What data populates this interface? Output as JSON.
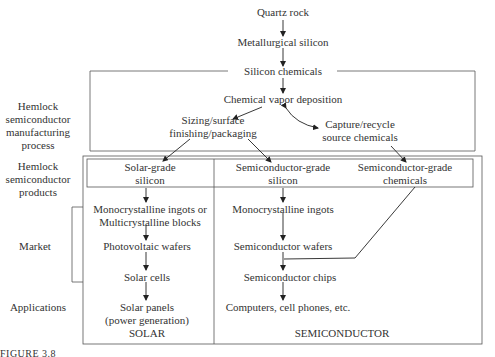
{
  "flow": {
    "quartz_rock": "Quartz rock",
    "metallurgical_silicon": "Metallurgical silicon",
    "silicon_chemicals": "Silicon chemicals",
    "cvd": "Chemical vapor deposition",
    "sizing_line1": "Sizing/surface",
    "sizing_line2": "finishing/packaging",
    "capture_line1": "Capture/recycle",
    "capture_line2": "source chemicals"
  },
  "products": {
    "solar_grade_line1": "Solar-grade",
    "solar_grade_line2": "silicon",
    "semi_grade_si_line1": "Semiconductor-grade",
    "semi_grade_si_line2": "silicon",
    "semi_grade_chem_line1": "Semiconductor-grade",
    "semi_grade_chem_line2": "chemicals"
  },
  "solar": {
    "ingots_line1": "Monocrystalline ingots or",
    "ingots_line2": "Multicrystalline blocks",
    "wafers": "Photovoltaic wafers",
    "cells": "Solar cells",
    "panels_line1": "Solar panels",
    "panels_line2": "(power generation)",
    "label": "SOLAR"
  },
  "semiconductor": {
    "ingots": "Monocrystalline ingots",
    "wafers": "Semiconductor wafers",
    "chips": "Semiconductor chips",
    "apps": "Computers, cell phones, etc.",
    "label": "SEMICONDUCTOR"
  },
  "side_labels": {
    "manufacturing_line1": "Hemlock",
    "manufacturing_line2": "semiconductor",
    "manufacturing_line3": "manufacturing",
    "manufacturing_line4": "process",
    "products_line1": "Hemlock",
    "products_line2": "semiconductor",
    "products_line3": "products",
    "market": "Market",
    "applications": "Applications"
  },
  "caption": "FIGURE 3.8"
}
